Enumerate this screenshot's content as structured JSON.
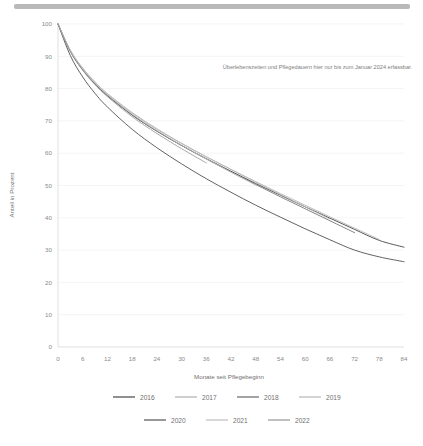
{
  "page": {
    "top_bar": "scroll-divider"
  },
  "chart_data": {
    "type": "line",
    "title": "",
    "xlabel": "Monate seit Pflegebeginn",
    "ylabel": "Anteil in Prozent",
    "xlim": [
      0,
      84
    ],
    "ylim": [
      0,
      100
    ],
    "xticks": [
      0,
      6,
      12,
      18,
      24,
      30,
      36,
      42,
      48,
      54,
      60,
      66,
      72,
      78,
      84
    ],
    "yticks": [
      0,
      10,
      20,
      30,
      40,
      50,
      60,
      70,
      80,
      90,
      100
    ],
    "grid": "horizontal",
    "legend_position": "bottom",
    "annotations": [
      {
        "text": "Überlebenszeiten und Pflegedauern hier nur bis zum Januar 2024 erfassbar.",
        "x": 40,
        "y": 86
      }
    ],
    "x": [
      0,
      3,
      6,
      9,
      12,
      18,
      24,
      30,
      36,
      42,
      48,
      54,
      60,
      66,
      72,
      78,
      84
    ],
    "series": [
      {
        "name": "2016",
        "color": "#4f4f4f",
        "values": [
          100,
          91.5,
          85.8,
          81.4,
          77.8,
          71.8,
          66.8,
          62.4,
          58.3,
          54.4,
          50.6,
          47.0,
          43.4,
          39.9,
          36.4,
          33.0,
          30.9
        ]
      },
      {
        "name": "2017",
        "color": "#b0b0b0",
        "values": [
          100,
          91.8,
          86.2,
          81.9,
          78.3,
          72.4,
          67.4,
          63.0,
          58.9,
          55.0,
          51.2,
          47.5,
          43.9,
          40.3,
          36.8,
          33.3,
          null
        ]
      },
      {
        "name": "2018",
        "color": "#6e6e6e",
        "values": [
          100,
          91.6,
          85.9,
          81.5,
          77.9,
          71.9,
          66.9,
          62.4,
          58.2,
          54.2,
          50.3,
          46.5,
          42.8,
          39.1,
          35.4,
          null,
          null
        ]
      },
      {
        "name": "2019",
        "color": "#b8b8b8",
        "values": [
          100,
          91.9,
          86.4,
          82.1,
          78.5,
          72.6,
          67.6,
          63.1,
          58.9,
          54.9,
          51.0,
          47.2,
          43.4,
          39.6,
          null,
          null,
          null
        ]
      },
      {
        "name": "2020",
        "color": "#5a5a5a",
        "values": [
          100,
          90.2,
          83.6,
          78.5,
          74.3,
          67.4,
          61.7,
          56.7,
          52.1,
          47.9,
          43.9,
          40.2,
          36.6,
          33.2,
          30.0,
          27.9,
          26.4
        ]
      },
      {
        "name": "2021",
        "color": "#c0c0c0",
        "values": [
          100,
          91.7,
          86.1,
          81.7,
          78.1,
          72.1,
          67.0,
          62.5,
          58.2,
          54.1,
          50.1,
          null,
          null,
          null,
          null,
          null,
          null
        ]
      },
      {
        "name": "2022",
        "color": "#9a9a9a",
        "values": [
          100,
          91.4,
          85.7,
          81.2,
          77.5,
          71.3,
          66.1,
          61.4,
          57.0,
          null,
          null,
          null,
          null,
          null,
          null,
          null,
          null
        ]
      }
    ]
  },
  "legend": {
    "rows": [
      [
        {
          "label": "2016",
          "color": "#4f4f4f"
        },
        {
          "label": "2017",
          "color": "#b0b0b0"
        },
        {
          "label": "2018",
          "color": "#6e6e6e"
        },
        {
          "label": "2019",
          "color": "#b8b8b8"
        }
      ],
      [
        {
          "label": "2020",
          "color": "#5a5a5a"
        },
        {
          "label": "2021",
          "color": "#c0c0c0"
        },
        {
          "label": "2022",
          "color": "#9a9a9a"
        }
      ]
    ]
  }
}
